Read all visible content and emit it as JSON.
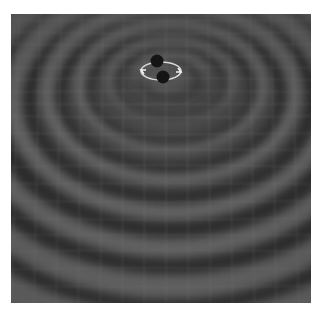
{
  "image": {
    "subject": "Binary black hole system producing gravitational waves rippling across a spacetime grid",
    "style": "grayscale 3D illustration",
    "colors": {
      "background": "#ffffff",
      "trough": "#363636",
      "surface": "#4c4c4c",
      "ridge": "#727272",
      "grid": "#9a9a9a",
      "black_hole": "#151515",
      "orbit": "#e8e8e8"
    },
    "center": {
      "x": 154,
      "y": 58
    },
    "black_holes": [
      {
        "label": "black-hole-1",
        "cx": 146,
        "cy": 47,
        "r": 6.5
      },
      {
        "label": "black-hole-2",
        "cx": 152,
        "cy": 63,
        "r": 6.5
      }
    ],
    "orbit": {
      "cx": 150,
      "cy": 57,
      "rx": 20,
      "ry": 9
    },
    "ripples": [
      {
        "rx": 34,
        "ry": 20,
        "dy": 8
      },
      {
        "rx": 62,
        "ry": 40,
        "dy": 22
      },
      {
        "rx": 92,
        "ry": 62,
        "dy": 38
      },
      {
        "rx": 124,
        "ry": 86,
        "dy": 55
      },
      {
        "rx": 158,
        "ry": 112,
        "dy": 74
      },
      {
        "rx": 194,
        "ry": 140,
        "dy": 96
      },
      {
        "rx": 232,
        "ry": 170,
        "dy": 120
      },
      {
        "rx": 272,
        "ry": 202,
        "dy": 146
      }
    ]
  }
}
